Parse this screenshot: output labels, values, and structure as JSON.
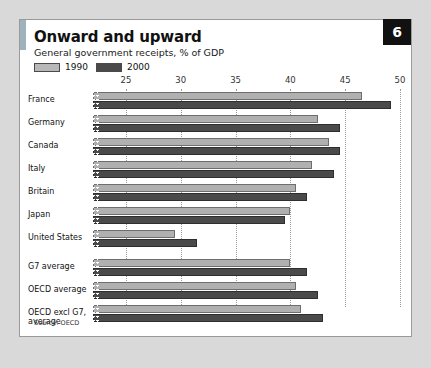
{
  "badge": "6",
  "title": "Onward and upward",
  "subtitle": "General government receipts, % of GDP",
  "source": "Source: OECD",
  "legend": [
    {
      "label": "1990",
      "color": "#b0b0b0"
    },
    {
      "label": "2000",
      "color": "#4a4a4a"
    }
  ],
  "colors": {
    "series_1990": "#b0b0b0",
    "series_2000": "#4a4a4a",
    "accent": "#9fb3bd",
    "badge_bg": "#111111",
    "page_bg": "#d9d9d9",
    "card_bg": "#ffffff"
  },
  "chart_data": {
    "type": "bar",
    "orientation": "horizontal",
    "title": "Onward and upward",
    "subtitle": "General government receipts, % of GDP",
    "xlabel": "",
    "ylabel": "",
    "xlim": [
      22,
      51
    ],
    "axis_break": true,
    "ticks": [
      25,
      30,
      35,
      40,
      45,
      50
    ],
    "grid": "vertical-dotted",
    "legend_position": "top-left",
    "source": "Source: OECD",
    "categories": [
      "France",
      "Germany",
      "Canada",
      "Italy",
      "Britain",
      "Japan",
      "United States",
      "G7 average",
      "OECD average",
      "OECD excl G7, average"
    ],
    "series": [
      {
        "name": "1990",
        "values": [
          46.5,
          42.5,
          43.5,
          42.0,
          40.5,
          40.0,
          29.5,
          40.0,
          40.5,
          41.0
        ]
      },
      {
        "name": "2000",
        "values": [
          49.2,
          44.5,
          44.5,
          44.0,
          41.5,
          39.5,
          31.5,
          41.5,
          42.5,
          43.0
        ]
      }
    ]
  }
}
